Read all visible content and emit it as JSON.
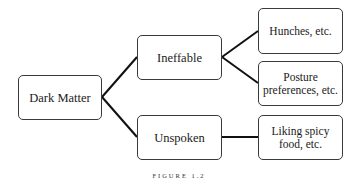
{
  "diagram": {
    "type": "tree",
    "root": {
      "label": "Dark Matter",
      "children": [
        {
          "label": "Ineffable",
          "children": [
            {
              "label": "Hunches, etc."
            },
            {
              "label": "Posture preferences, etc.",
              "lines": [
                "Posture",
                "preferences, etc."
              ]
            }
          ]
        },
        {
          "label": "Unspoken",
          "children": [
            {
              "label": "Liking spicy food, etc.",
              "lines": [
                "Liking spicy",
                "food, etc."
              ]
            }
          ]
        }
      ]
    },
    "caption": "FIGURE 1.2",
    "colors": {
      "line": "#111111",
      "border": "#3a3a3a",
      "text": "#1a1a1a",
      "background": "#ffffff"
    }
  }
}
